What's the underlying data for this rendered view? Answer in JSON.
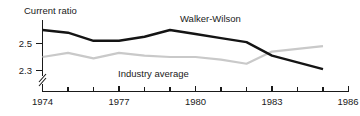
{
  "chart_data": {
    "type": "line",
    "title": "",
    "ylabel": "Current ratio",
    "xlabel": "",
    "xlim": [
      1974,
      1986
    ],
    "ylim": [
      2.22,
      2.63
    ],
    "grid": false,
    "legend_position": "inline-annotation",
    "ytick_labels": [
      "2.5",
      "2.3"
    ],
    "ytick_values": [
      2.5,
      2.3
    ],
    "xtick_values": [
      1974,
      1975,
      1976,
      1977,
      1978,
      1979,
      1980,
      1981,
      1982,
      1983,
      1984,
      1985,
      1986
    ],
    "xtick_labels": [
      "1974",
      "",
      "",
      "1977",
      "",
      "",
      "1980",
      "",
      "",
      "1983",
      "",
      "",
      "1986"
    ],
    "axis_break": true,
    "axis_break_note": "y-axis broken below 2.3",
    "x": [
      1974,
      1975,
      1976,
      1977,
      1978,
      1979,
      1980,
      1981,
      1982,
      1983,
      1984,
      1985
    ],
    "series": [
      {
        "name": "Walker-Wilson",
        "color": "#141414",
        "values": [
          2.6,
          2.58,
          2.52,
          2.52,
          2.55,
          2.6,
          2.57,
          2.54,
          2.51,
          2.41,
          2.36,
          2.31
        ]
      },
      {
        "name": "Industry average",
        "color": "#c9c9c9",
        "values": [
          2.4,
          2.43,
          2.39,
          2.43,
          2.41,
          2.4,
          2.4,
          2.38,
          2.35,
          2.44,
          2.46,
          2.48
        ]
      }
    ],
    "annotations": [
      {
        "text": "Walker-Wilson",
        "x": 1979.3,
        "y": 2.62
      },
      {
        "text": "Industry average",
        "x": 1977.6,
        "y": 2.3
      }
    ]
  }
}
